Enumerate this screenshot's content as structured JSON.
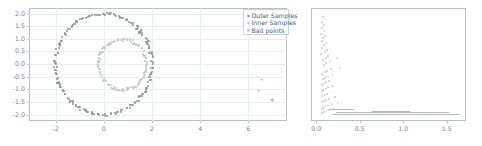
{
  "figure": {
    "background": "#ffffff",
    "panel_count": 2
  },
  "colors": {
    "outer_samples": "#8e959c",
    "inner_samples": "#c2c7cc",
    "bad_points": "#c9ced3",
    "right_points": "#c6cbd0",
    "grid": "#e9ecef",
    "spine": "#b9bec4",
    "tick_text": "#7b8087",
    "legend_border": "#cdd2d7",
    "legend_text": "#53585e"
  },
  "legend": {
    "position": "upper-right",
    "entries": [
      {
        "label": "Outer Samples",
        "marker": "dot-icon",
        "color": "#8e959c"
      },
      {
        "label": "Inner Samples",
        "marker": "dot-icon",
        "color": "#c2c7cc"
      },
      {
        "label": "Bad points",
        "marker": "dot-icon",
        "color": "#c9ced3"
      }
    ]
  },
  "chart_data": [
    {
      "id": "left-panel",
      "type": "scatter",
      "title": "",
      "xlabel": "",
      "ylabel": "",
      "xlim": [
        -3.1,
        7.6
      ],
      "ylim": [
        -2.25,
        2.22
      ],
      "xticks": [
        -2,
        0,
        2,
        4,
        6
      ],
      "xticklabels": [
        "-2",
        "0",
        "2",
        "4",
        "6"
      ],
      "yticks": [
        -2.0,
        -1.5,
        -1.0,
        -0.5,
        0.0,
        0.5,
        1.0,
        1.5,
        2.0
      ],
      "yticklabels": [
        "-2.0",
        "-1.5",
        "-1.0",
        "-0.5",
        "0.0",
        "0.5",
        "1.0",
        "1.5",
        "2.0"
      ],
      "grid": true,
      "grid_axis": "both",
      "legend": true,
      "series": [
        {
          "name": "Outer Samples",
          "color": "#8e959c",
          "shape": "noisy-circle",
          "center": [
            0.0,
            0.0
          ],
          "radius": 2.0,
          "radial_noise": 0.06,
          "n_points": 170
        },
        {
          "name": "Inner Samples",
          "color": "#c2c7cc",
          "shape": "noisy-circle",
          "center": [
            0.78,
            -0.02
          ],
          "radius": 1.0,
          "radial_noise": 0.055,
          "n_points": 110
        },
        {
          "name": "Bad points",
          "color": "#c9ced3",
          "shape": "outliers",
          "points": [
            [
              6.55,
              -0.62
            ],
            [
              6.42,
              -1.05
            ],
            [
              6.98,
              -1.42
            ]
          ]
        }
      ]
    },
    {
      "id": "right-panel",
      "type": "scatter",
      "title": "",
      "xlabel": "",
      "ylabel": "",
      "xlim": [
        -0.06,
        1.72
      ],
      "ylim": [
        -0.04,
        1.04
      ],
      "xticks": [
        0.0,
        0.5,
        1.0,
        1.5
      ],
      "xticklabels": [
        "0.0",
        "0.5",
        "1.0",
        "1.5"
      ],
      "yticks": [],
      "yticklabels": [],
      "grid": false,
      "legend": false,
      "series": [
        {
          "name": "residual-cloud",
          "color": "#c6cbd0",
          "shape": "decaying-cloud",
          "points": [
            [
              0.075,
              0.955
            ],
            [
              0.062,
              0.905
            ],
            [
              0.088,
              0.88
            ],
            [
              0.07,
              0.845
            ],
            [
              0.095,
              0.82
            ],
            [
              0.058,
              0.795
            ],
            [
              0.105,
              0.775
            ],
            [
              0.08,
              0.75
            ],
            [
              0.066,
              0.722
            ],
            [
              0.118,
              0.705
            ],
            [
              0.09,
              0.682
            ],
            [
              0.072,
              0.66
            ],
            [
              0.128,
              0.64
            ],
            [
              0.098,
              0.618
            ],
            [
              0.06,
              0.6
            ],
            [
              0.14,
              0.582
            ],
            [
              0.108,
              0.562
            ],
            [
              0.082,
              0.545
            ],
            [
              0.235,
              0.56
            ],
            [
              0.16,
              0.528
            ],
            [
              0.115,
              0.51
            ],
            [
              0.092,
              0.492
            ],
            [
              0.268,
              0.47
            ],
            [
              0.172,
              0.455
            ],
            [
              0.125,
              0.44
            ],
            [
              0.098,
              0.425
            ],
            [
              0.07,
              0.412
            ],
            [
              0.188,
              0.398
            ],
            [
              0.135,
              0.385
            ],
            [
              0.105,
              0.372
            ],
            [
              0.078,
              0.358
            ],
            [
              0.15,
              0.345
            ],
            [
              0.112,
              0.332
            ],
            [
              0.088,
              0.318
            ],
            [
              0.065,
              0.305
            ],
            [
              0.198,
              0.295
            ],
            [
              0.14,
              0.282
            ],
            [
              0.108,
              0.27
            ],
            [
              0.082,
              0.258
            ],
            [
              0.062,
              0.245
            ],
            [
              0.165,
              0.232
            ],
            [
              0.122,
              0.22
            ],
            [
              0.095,
              0.208
            ],
            [
              0.072,
              0.196
            ],
            [
              0.215,
              0.185
            ],
            [
              0.152,
              0.172
            ],
            [
              0.115,
              0.162
            ],
            [
              0.088,
              0.15
            ],
            [
              0.068,
              0.14
            ],
            [
              0.245,
              0.128
            ],
            [
              0.178,
              0.118
            ],
            [
              0.132,
              0.108
            ],
            [
              0.102,
              0.098
            ],
            [
              0.08,
              0.088
            ],
            [
              0.062,
              0.078
            ],
            [
              0.195,
              0.07
            ],
            [
              0.148,
              0.062
            ],
            [
              0.118,
              0.054
            ],
            [
              0.092,
              0.046
            ],
            [
              0.072,
              0.04
            ]
          ]
        },
        {
          "name": "baseline-runs",
          "color": "#b4b9bf",
          "shape": "horizontal-segments",
          "segments": [
            {
              "x0": 0.185,
              "x1": 1.655,
              "y": 0.03
            },
            {
              "x0": 0.225,
              "x1": 1.52,
              "y": 0.046
            },
            {
              "x0": 0.64,
              "x1": 1.075,
              "y": 0.058
            },
            {
              "x0": 0.155,
              "x1": 0.43,
              "y": 0.07
            }
          ]
        }
      ]
    }
  ]
}
